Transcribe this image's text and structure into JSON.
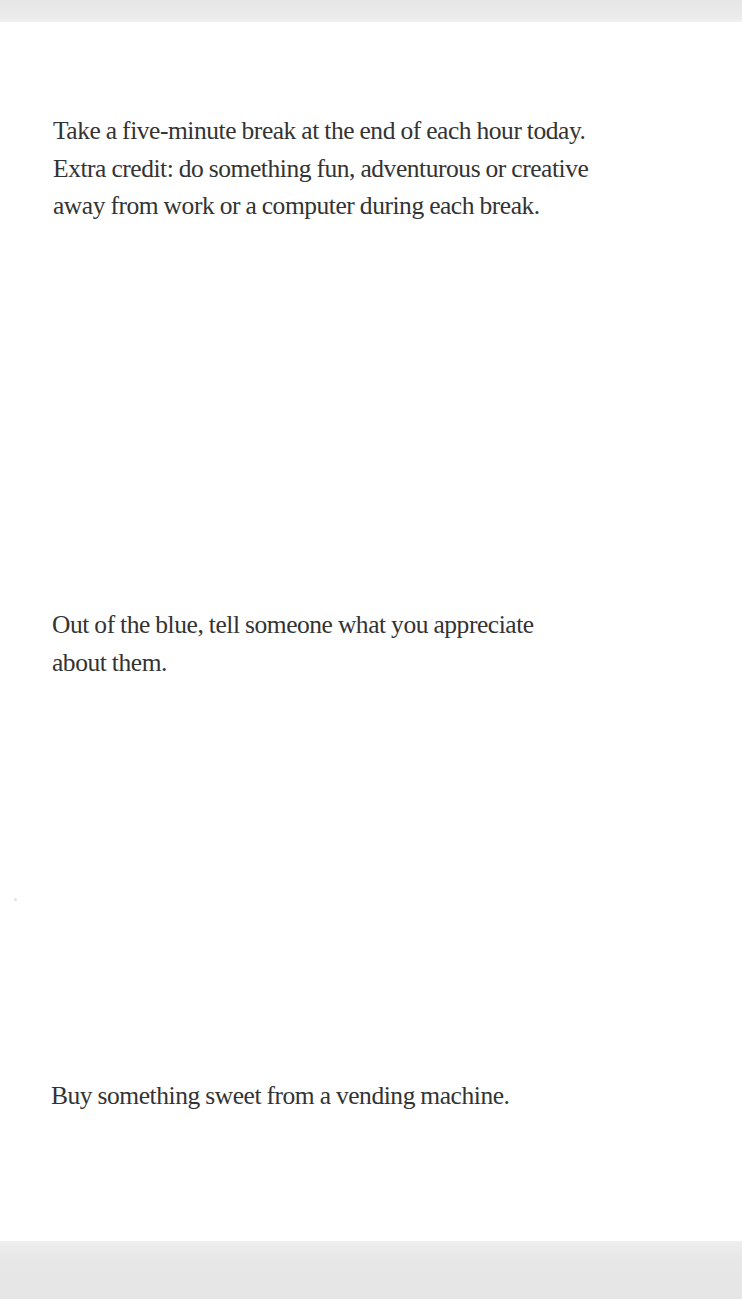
{
  "document": {
    "prompts": [
      {
        "text": "Take a five-minute break at the end of each hour today.\nExtra credit: do something fun, adventurous or creative\naway from work or a computer during each break."
      },
      {
        "text": "Out of the blue, tell someone what you appreciate\nabout them."
      },
      {
        "text": "Buy something sweet from a vending machine."
      }
    ]
  },
  "colors": {
    "text": "#333333",
    "page": "#ffffff",
    "scan_edge": "#e6e6e6"
  }
}
